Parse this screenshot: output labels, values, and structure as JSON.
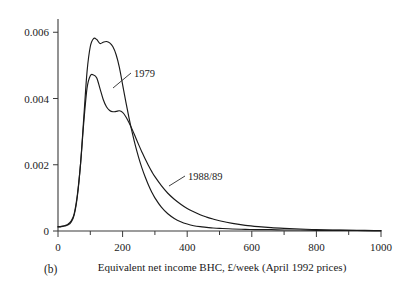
{
  "panel": {
    "label": "(b)"
  },
  "chart_data": {
    "type": "line",
    "title": "",
    "subtitle": "",
    "xlabel": "Equivalent net income BHC, £/week (April 1992 prices)",
    "ylabel": "",
    "xlim": [
      0,
      1000
    ],
    "ylim": [
      0,
      0.0064
    ],
    "grid": false,
    "legend_position": "inline-annotation",
    "xticks": [
      0,
      200,
      400,
      600,
      800,
      1000
    ],
    "xtick_labels": [
      "0",
      "200",
      "400",
      "600",
      "800",
      "1000"
    ],
    "xminor_ticks": [
      100,
      300,
      500,
      700,
      900
    ],
    "yticks": [
      0,
      0.002,
      0.004,
      0.006
    ],
    "ytick_labels": [
      "0",
      "0.002",
      "0.004",
      "0.006"
    ],
    "annotations": [
      {
        "text": "1979",
        "x": 250,
        "y": 0.00475
      },
      {
        "text": "1988/89",
        "x": 480,
        "y": 0.00165
      }
    ],
    "series": [
      {
        "name": "1979",
        "color": "#1a1a1a",
        "x": [
          0,
          10,
          20,
          30,
          40,
          50,
          60,
          70,
          80,
          90,
          100,
          110,
          120,
          130,
          140,
          150,
          160,
          170,
          180,
          190,
          200,
          210,
          220,
          230,
          240,
          250,
          260,
          270,
          280,
          290,
          300,
          320,
          340,
          360,
          380,
          400,
          420,
          440,
          460,
          480,
          500,
          540,
          580,
          620,
          660,
          700,
          750,
          800,
          850,
          900,
          950,
          1000
        ],
        "values": [
          0.00012,
          0.00013,
          0.00015,
          0.00018,
          0.00026,
          0.00048,
          0.00105,
          0.00205,
          0.00345,
          0.00482,
          0.00557,
          0.00581,
          0.00578,
          0.00566,
          0.0057,
          0.00572,
          0.00568,
          0.00556,
          0.00532,
          0.00494,
          0.00442,
          0.0039,
          0.00341,
          0.00296,
          0.00256,
          0.00221,
          0.0019,
          0.00163,
          0.00139,
          0.00118,
          0.001,
          0.00072,
          0.00052,
          0.00038,
          0.00028,
          0.00021,
          0.00016,
          0.00013,
          0.00011,
          9e-05,
          8e-05,
          6e-05,
          5e-05,
          4e-05,
          4e-05,
          3e-05,
          3e-05,
          2e-05,
          2e-05,
          2e-05,
          1e-05,
          1e-05
        ]
      },
      {
        "name": "1988/89",
        "color": "#1a1a1a",
        "x": [
          0,
          10,
          20,
          30,
          40,
          50,
          60,
          70,
          80,
          90,
          100,
          110,
          120,
          130,
          140,
          150,
          160,
          170,
          180,
          190,
          200,
          210,
          220,
          230,
          240,
          250,
          260,
          270,
          280,
          290,
          300,
          320,
          340,
          360,
          380,
          400,
          420,
          440,
          460,
          480,
          500,
          540,
          580,
          620,
          660,
          700,
          750,
          800,
          850,
          900,
          950,
          1000
        ],
        "values": [
          0.00013,
          0.00014,
          0.00016,
          0.0002,
          0.00029,
          0.00052,
          0.0011,
          0.00205,
          0.0033,
          0.00432,
          0.00469,
          0.00471,
          0.00462,
          0.0043,
          0.00397,
          0.00375,
          0.00364,
          0.0036,
          0.00361,
          0.00363,
          0.00358,
          0.00345,
          0.00327,
          0.00306,
          0.00283,
          0.0026,
          0.00238,
          0.00217,
          0.00198,
          0.0018,
          0.00164,
          0.00137,
          0.00114,
          0.00096,
          0.00081,
          0.00068,
          0.00058,
          0.00049,
          0.00042,
          0.00036,
          0.00031,
          0.00023,
          0.00017,
          0.00013,
          0.0001,
          8e-05,
          6e-05,
          4e-05,
          3e-05,
          2e-05,
          2e-05,
          1e-05
        ]
      }
    ]
  }
}
